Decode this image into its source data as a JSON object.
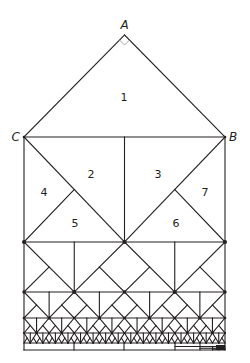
{
  "diagram": {
    "type": "geometric-dissection",
    "vertices": {
      "A": {
        "label": "A",
        "x": 124.5,
        "y": 35
      },
      "B": {
        "label": "B",
        "x": 225,
        "y": 137
      },
      "C": {
        "label": "C",
        "x": 24,
        "y": 137
      }
    },
    "right_angle_marker_at": "A",
    "regions": [
      {
        "id": "1",
        "label": "1",
        "x": 124,
        "y": 97
      },
      {
        "id": "2",
        "label": "2",
        "x": 91,
        "y": 174
      },
      {
        "id": "3",
        "label": "3",
        "x": 158,
        "y": 174
      },
      {
        "id": "4",
        "label": "4",
        "x": 44,
        "y": 192
      },
      {
        "id": "5",
        "label": "5",
        "x": 75,
        "y": 223
      },
      {
        "id": "6",
        "label": "6",
        "x": 176,
        "y": 223
      },
      {
        "id": "7",
        "label": "7",
        "x": 205,
        "y": 192
      }
    ],
    "frame": {
      "left": 24,
      "right": 225,
      "top": 137
    },
    "bands": [
      {
        "top": 137,
        "bottom": 242,
        "columns": 1
      },
      {
        "top": 242,
        "bottom": 292,
        "columns": 2
      },
      {
        "top": 292,
        "bottom": 318,
        "columns": 4
      },
      {
        "top": 318,
        "bottom": 333,
        "columns": 8
      },
      {
        "top": 333,
        "bottom": 343,
        "columns": 16
      }
    ],
    "base": {
      "top": 343,
      "bottom": 350,
      "divisions": [
        74,
        124,
        175
      ]
    },
    "stroke_color": "#231f20",
    "node_color": "#231f20"
  }
}
